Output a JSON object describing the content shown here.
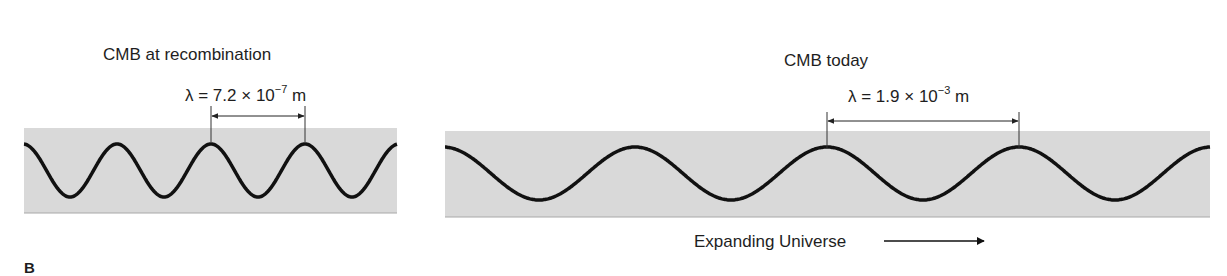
{
  "figure": {
    "panel_label": "B",
    "band_color": "#d9d9d9",
    "wave_color": "#111111",
    "left_panel": {
      "title": "CMB at recombination",
      "wavelength_label": {
        "symbol": "λ",
        "prefix": " = 7.2 × 10",
        "exponent": "−7",
        "unit": " m"
      },
      "wavelength_m": 7.2e-07,
      "cycles_shown": 4
    },
    "right_panel": {
      "title": "CMB today",
      "wavelength_label": {
        "symbol": "λ",
        "prefix": " = 1.9 × 10",
        "exponent": "−3",
        "unit": " m"
      },
      "wavelength_m": 0.0019,
      "cycles_shown": 4,
      "caption": "Expanding Universe",
      "caption_arrow": "right-arrow"
    }
  }
}
